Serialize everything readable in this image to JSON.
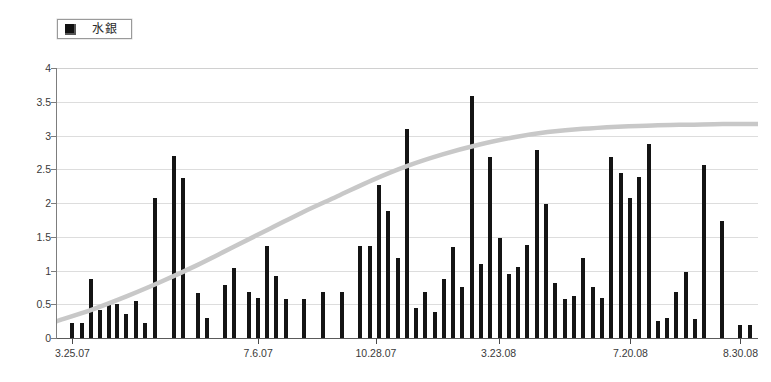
{
  "legend": {
    "marker_icon": "filled-square-icon",
    "label": "水銀",
    "series_color": "#141414"
  },
  "chart_data": {
    "type": "bar",
    "title": "",
    "xlabel": "",
    "ylabel": "",
    "ylim": [
      0,
      4
    ],
    "ytick_labels": [
      "0",
      "0.5",
      "1",
      "1.5",
      "2",
      "2.5",
      "3",
      "3.5",
      "4"
    ],
    "ytick_values": [
      0,
      0.5,
      1,
      1.5,
      2,
      2.5,
      3,
      3.5,
      4
    ],
    "grid": true,
    "legend_position": "top-left",
    "xtick_labels": [
      "3.25.07",
      "7.6.07",
      "10.28.07",
      "3.23.08",
      "7.20.08",
      "8.30.08"
    ],
    "xtick_positions": [
      0.022,
      0.287,
      0.455,
      0.63,
      0.818,
      0.975
    ],
    "series": [
      {
        "name": "水銀",
        "type": "bar",
        "color": "#141414",
        "x": [
          0.022,
          0.035,
          0.049,
          0.062,
          0.074,
          0.086,
          0.099,
          0.113,
          0.126,
          0.14,
          0.167,
          0.18,
          0.201,
          0.214,
          0.24,
          0.253,
          0.274,
          0.287,
          0.3,
          0.313,
          0.327,
          0.353,
          0.379,
          0.406,
          0.432,
          0.446,
          0.459,
          0.472,
          0.486,
          0.499,
          0.512,
          0.525,
          0.539,
          0.552,
          0.565,
          0.578,
          0.592,
          0.605,
          0.618,
          0.632,
          0.645,
          0.658,
          0.671,
          0.685,
          0.698,
          0.711,
          0.724,
          0.738,
          0.751,
          0.764,
          0.777,
          0.791,
          0.804,
          0.817,
          0.83,
          0.844,
          0.857,
          0.87,
          0.883,
          0.897,
          0.91,
          0.923,
          0.949,
          0.975,
          0.988
        ],
        "values": [
          0.22,
          0.22,
          0.88,
          0.42,
          0.5,
          0.5,
          0.36,
          0.55,
          0.22,
          2.07,
          2.7,
          2.37,
          0.66,
          0.3,
          0.78,
          1.03,
          0.68,
          0.6,
          1.37,
          0.92,
          0.58,
          0.58,
          0.68,
          0.68,
          1.37,
          1.37,
          2.27,
          1.88,
          1.18,
          3.1,
          0.45,
          0.68,
          0.38,
          0.88,
          1.35,
          0.76,
          3.58,
          1.1,
          2.68,
          1.48,
          0.95,
          1.05,
          1.38,
          2.78,
          1.98,
          0.82,
          0.58,
          0.62,
          1.18,
          0.75,
          0.6,
          2.68,
          2.45,
          2.08,
          2.38,
          2.88,
          0.25,
          0.3,
          0.68,
          0.98,
          0.28,
          2.57,
          1.73,
          0.2,
          0.2
        ]
      },
      {
        "name": "trend",
        "type": "line",
        "color": "#c8c8c8",
        "style": "smooth-logistic",
        "points": [
          [
            0.0,
            0.25
          ],
          [
            0.05,
            0.42
          ],
          [
            0.1,
            0.62
          ],
          [
            0.15,
            0.84
          ],
          [
            0.2,
            1.08
          ],
          [
            0.25,
            1.34
          ],
          [
            0.3,
            1.6
          ],
          [
            0.35,
            1.86
          ],
          [
            0.4,
            2.1
          ],
          [
            0.45,
            2.34
          ],
          [
            0.5,
            2.55
          ],
          [
            0.55,
            2.72
          ],
          [
            0.6,
            2.86
          ],
          [
            0.65,
            2.97
          ],
          [
            0.7,
            3.05
          ],
          [
            0.75,
            3.1
          ],
          [
            0.8,
            3.13
          ],
          [
            0.85,
            3.15
          ],
          [
            0.9,
            3.16
          ],
          [
            0.95,
            3.17
          ],
          [
            1.0,
            3.17
          ]
        ]
      }
    ]
  }
}
